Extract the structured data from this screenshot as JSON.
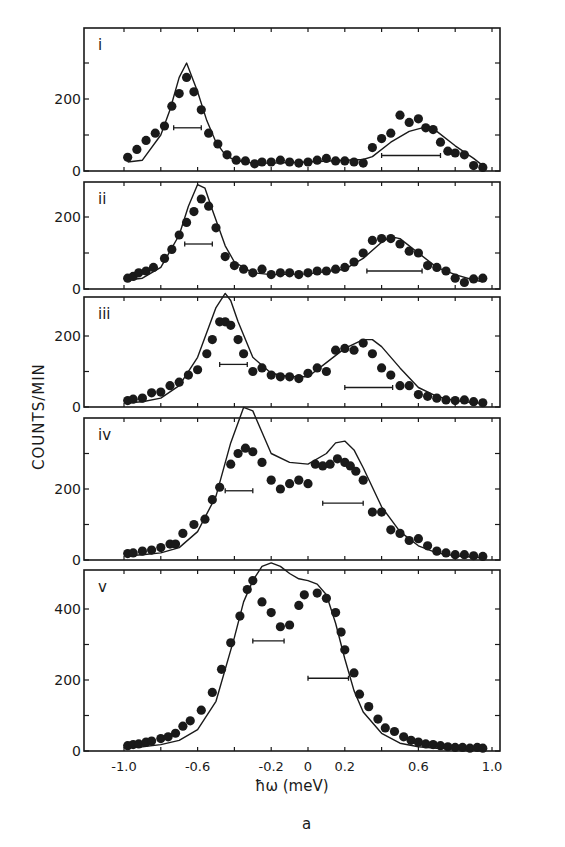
{
  "chart_data": [
    {
      "type": "scatter",
      "panel": "i",
      "xlabel": "ħω (meV)",
      "ylabel": "COUNTS/MIN",
      "xlim": [
        -1.2,
        1.2
      ],
      "ylim": [
        0,
        400
      ],
      "yticks": [
        0,
        200
      ],
      "series": [
        {
          "name": "data",
          "x": [
            -0.98,
            -0.93,
            -0.88,
            -0.83,
            -0.78,
            -0.74,
            -0.7,
            -0.66,
            -0.62,
            -0.58,
            -0.54,
            -0.49,
            -0.44,
            -0.39,
            -0.34,
            -0.29,
            -0.25,
            -0.2,
            -0.15,
            -0.1,
            -0.05,
            0,
            0.05,
            0.1,
            0.15,
            0.2,
            0.25,
            0.3,
            0.35,
            0.4,
            0.45,
            0.5,
            0.55,
            0.6,
            0.64,
            0.68,
            0.72,
            0.76,
            0.8,
            0.85,
            0.9,
            0.95
          ],
          "y": [
            38,
            60,
            85,
            105,
            125,
            180,
            215,
            260,
            220,
            170,
            105,
            75,
            45,
            30,
            28,
            20,
            25,
            25,
            30,
            25,
            22,
            25,
            30,
            35,
            28,
            28,
            25,
            22,
            65,
            90,
            105,
            155,
            135,
            145,
            120,
            115,
            80,
            55,
            50,
            45,
            15,
            10
          ]
        },
        {
          "name": "model",
          "x": [
            -0.98,
            -0.9,
            -0.8,
            -0.75,
            -0.7,
            -0.66,
            -0.6,
            -0.55,
            -0.5,
            -0.45,
            -0.4,
            -0.3,
            -0.2,
            0,
            0.2,
            0.3,
            0.35,
            0.45,
            0.55,
            0.62,
            0.7,
            0.8,
            0.9,
            0.95
          ],
          "y": [
            25,
            30,
            100,
            170,
            260,
            300,
            220,
            140,
            80,
            45,
            30,
            22,
            22,
            25,
            30,
            32,
            40,
            80,
            110,
            120,
            110,
            70,
            35,
            15
          ]
        }
      ],
      "resolution_bars": [
        {
          "x0": -0.73,
          "x1": -0.58,
          "y": 120
        },
        {
          "x0": 0.4,
          "x1": 0.72,
          "y": 43
        }
      ]
    },
    {
      "type": "scatter",
      "panel": "ii",
      "ylim": [
        0,
        300
      ],
      "yticks": [
        0,
        200
      ],
      "series": [
        {
          "name": "data",
          "x": [
            -0.98,
            -0.95,
            -0.92,
            -0.88,
            -0.84,
            -0.78,
            -0.74,
            -0.7,
            -0.66,
            -0.62,
            -0.58,
            -0.54,
            -0.5,
            -0.45,
            -0.4,
            -0.35,
            -0.3,
            -0.25,
            -0.2,
            -0.15,
            -0.1,
            -0.05,
            0,
            0.05,
            0.1,
            0.15,
            0.2,
            0.25,
            0.3,
            0.35,
            0.4,
            0.45,
            0.5,
            0.55,
            0.6,
            0.65,
            0.7,
            0.75,
            0.8,
            0.85,
            0.9,
            0.95
          ],
          "y": [
            30,
            35,
            45,
            50,
            60,
            85,
            110,
            150,
            185,
            215,
            250,
            230,
            170,
            90,
            65,
            55,
            45,
            55,
            40,
            45,
            45,
            40,
            45,
            50,
            50,
            55,
            60,
            75,
            100,
            135,
            140,
            140,
            125,
            105,
            100,
            65,
            60,
            50,
            30,
            18,
            28,
            30
          ]
        },
        {
          "name": "model",
          "x": [
            -0.98,
            -0.9,
            -0.8,
            -0.7,
            -0.65,
            -0.6,
            -0.56,
            -0.52,
            -0.45,
            -0.4,
            -0.3,
            -0.2,
            0,
            0.2,
            0.3,
            0.4,
            0.45,
            0.5,
            0.6,
            0.7,
            0.8,
            0.9,
            0.95
          ],
          "y": [
            25,
            30,
            60,
            150,
            230,
            290,
            280,
            220,
            120,
            75,
            45,
            40,
            42,
            55,
            85,
            130,
            145,
            140,
            100,
            60,
            40,
            25,
            20
          ]
        }
      ],
      "resolution_bars": [
        {
          "x0": -0.67,
          "x1": -0.52,
          "y": 125
        },
        {
          "x0": 0.32,
          "x1": 0.62,
          "y": 50
        }
      ]
    },
    {
      "type": "scatter",
      "panel": "iii",
      "ylim": [
        0,
        300
      ],
      "yticks": [
        0,
        200
      ],
      "series": [
        {
          "name": "data",
          "x": [
            -0.98,
            -0.95,
            -0.9,
            -0.85,
            -0.8,
            -0.75,
            -0.7,
            -0.65,
            -0.6,
            -0.55,
            -0.52,
            -0.48,
            -0.45,
            -0.42,
            -0.38,
            -0.35,
            -0.3,
            -0.25,
            -0.2,
            -0.15,
            -0.1,
            -0.05,
            0,
            0.05,
            0.1,
            0.15,
            0.2,
            0.25,
            0.3,
            0.35,
            0.4,
            0.45,
            0.5,
            0.55,
            0.6,
            0.65,
            0.7,
            0.75,
            0.8,
            0.85,
            0.9,
            0.95
          ],
          "y": [
            18,
            22,
            25,
            40,
            42,
            60,
            70,
            90,
            105,
            150,
            190,
            240,
            240,
            230,
            190,
            150,
            100,
            110,
            90,
            85,
            85,
            80,
            95,
            110,
            100,
            160,
            165,
            160,
            180,
            150,
            110,
            90,
            60,
            60,
            35,
            30,
            25,
            20,
            18,
            20,
            15,
            12
          ]
        },
        {
          "name": "model",
          "x": [
            -0.98,
            -0.9,
            -0.8,
            -0.7,
            -0.6,
            -0.5,
            -0.45,
            -0.42,
            -0.38,
            -0.3,
            -0.2,
            -0.1,
            0,
            0.1,
            0.2,
            0.3,
            0.35,
            0.4,
            0.5,
            0.6,
            0.7,
            0.8,
            0.9,
            0.95
          ],
          "y": [
            12,
            15,
            25,
            60,
            140,
            280,
            320,
            300,
            240,
            140,
            95,
            85,
            85,
            125,
            165,
            190,
            190,
            170,
            110,
            55,
            30,
            18,
            12,
            10
          ]
        }
      ],
      "resolution_bars": [
        {
          "x0": -0.48,
          "x1": -0.33,
          "y": 120
        },
        {
          "x0": 0.2,
          "x1": 0.46,
          "y": 55
        }
      ]
    },
    {
      "type": "scatter",
      "panel": "iv",
      "ylim": [
        0,
        400
      ],
      "yticks": [
        0,
        200
      ],
      "series": [
        {
          "name": "data",
          "x": [
            -0.98,
            -0.95,
            -0.9,
            -0.85,
            -0.8,
            -0.75,
            -0.72,
            -0.68,
            -0.62,
            -0.56,
            -0.52,
            -0.48,
            -0.42,
            -0.38,
            -0.34,
            -0.3,
            -0.25,
            -0.2,
            -0.15,
            -0.1,
            -0.05,
            0,
            0.04,
            0.08,
            0.12,
            0.16,
            0.2,
            0.23,
            0.26,
            0.3,
            0.35,
            0.4,
            0.45,
            0.5,
            0.55,
            0.6,
            0.65,
            0.7,
            0.75,
            0.8,
            0.85,
            0.9,
            0.95
          ],
          "y": [
            18,
            20,
            25,
            28,
            35,
            45,
            45,
            75,
            100,
            115,
            170,
            205,
            270,
            300,
            315,
            305,
            275,
            225,
            200,
            215,
            225,
            215,
            270,
            265,
            270,
            285,
            275,
            265,
            250,
            225,
            135,
            135,
            85,
            75,
            55,
            60,
            40,
            25,
            20,
            15,
            15,
            12,
            10
          ]
        },
        {
          "name": "model",
          "x": [
            -0.98,
            -0.9,
            -0.8,
            -0.7,
            -0.6,
            -0.5,
            -0.42,
            -0.35,
            -0.3,
            -0.25,
            -0.2,
            -0.1,
            0,
            0.1,
            0.15,
            0.2,
            0.25,
            0.3,
            0.4,
            0.5,
            0.6,
            0.7,
            0.8,
            0.9,
            0.95
          ],
          "y": [
            12,
            15,
            20,
            35,
            80,
            180,
            330,
            430,
            420,
            360,
            300,
            275,
            270,
            300,
            330,
            335,
            310,
            260,
            150,
            80,
            40,
            20,
            12,
            8,
            6
          ]
        }
      ],
      "resolution_bars": [
        {
          "x0": -0.45,
          "x1": -0.3,
          "y": 195
        },
        {
          "x0": 0.08,
          "x1": 0.3,
          "y": 160
        }
      ]
    },
    {
      "type": "scatter",
      "panel": "v",
      "ylim": [
        0,
        500
      ],
      "yticks": [
        0,
        200,
        400
      ],
      "series": [
        {
          "name": "data",
          "x": [
            -0.98,
            -0.95,
            -0.92,
            -0.88,
            -0.85,
            -0.8,
            -0.76,
            -0.72,
            -0.68,
            -0.64,
            -0.58,
            -0.52,
            -0.47,
            -0.42,
            -0.37,
            -0.33,
            -0.3,
            -0.25,
            -0.2,
            -0.15,
            -0.1,
            -0.05,
            -0.02,
            0.05,
            0.1,
            0.15,
            0.18,
            0.2,
            0.25,
            0.28,
            0.33,
            0.38,
            0.42,
            0.47,
            0.52,
            0.56,
            0.6,
            0.64,
            0.68,
            0.72,
            0.76,
            0.8,
            0.84,
            0.88,
            0.92,
            0.95
          ],
          "y": [
            15,
            18,
            20,
            25,
            28,
            35,
            40,
            50,
            70,
            85,
            115,
            165,
            230,
            305,
            380,
            455,
            480,
            420,
            390,
            350,
            355,
            410,
            440,
            445,
            430,
            390,
            335,
            285,
            220,
            160,
            125,
            90,
            65,
            55,
            40,
            30,
            25,
            20,
            18,
            15,
            12,
            10,
            10,
            8,
            10,
            8
          ]
        },
        {
          "name": "model",
          "x": [
            -0.98,
            -0.9,
            -0.8,
            -0.7,
            -0.6,
            -0.5,
            -0.4,
            -0.35,
            -0.3,
            -0.25,
            -0.2,
            -0.15,
            -0.1,
            -0.05,
            0,
            0.05,
            0.1,
            0.15,
            0.2,
            0.25,
            0.3,
            0.4,
            0.5,
            0.6,
            0.7,
            0.8,
            0.9,
            0.95
          ],
          "y": [
            10,
            12,
            18,
            30,
            60,
            140,
            320,
            420,
            480,
            520,
            530,
            520,
            500,
            485,
            480,
            470,
            440,
            360,
            260,
            170,
            110,
            50,
            22,
            12,
            8,
            6,
            5,
            4
          ]
        }
      ],
      "resolution_bars": [
        {
          "x0": -0.3,
          "x1": -0.13,
          "y": 310
        },
        {
          "x0": 0.0,
          "x1": 0.22,
          "y": 205
        }
      ]
    }
  ],
  "labels": {
    "ylabel": "COUNTS/MIN",
    "xlabel": "ħω  (meV)",
    "caption": "a",
    "panel_labels": [
      "i",
      "ii",
      "iii",
      "iv",
      "v"
    ],
    "xticks": [
      "-1.0",
      "-0.6",
      "-0.2",
      "0",
      "0.2",
      "0.6",
      "1.0"
    ],
    "xtick_values": [
      -1.0,
      -0.6,
      -0.2,
      0,
      0.2,
      0.6,
      1.0
    ]
  },
  "layout": {
    "frame_left": 84,
    "frame_right": 500,
    "x_origin_px": 308,
    "px_per_meV": 184,
    "panels": [
      {
        "top": 28,
        "zero": 171,
        "px_per_count": 0.36,
        "ytick_labels": [
          "0",
          "200"
        ],
        "minor_ticks": [
          100,
          300
        ]
      },
      {
        "top": 182,
        "zero": 289,
        "px_per_count": 0.36,
        "ytick_labels": [
          "0",
          "200"
        ],
        "minor_ticks": [
          100
        ]
      },
      {
        "top": 297,
        "zero": 407,
        "px_per_count": 0.355,
        "ytick_labels": [
          "0",
          "200"
        ],
        "minor_ticks": [
          100
        ]
      },
      {
        "top": 418,
        "zero": 560,
        "px_per_count": 0.355,
        "ytick_labels": [
          "0",
          "200"
        ],
        "minor_ticks": [
          100,
          300
        ]
      },
      {
        "top": 570,
        "zero": 751,
        "px_per_count": 0.355,
        "ytick_labels": [
          "0",
          "200",
          "400"
        ],
        "minor_ticks": [
          100,
          300
        ]
      }
    ]
  }
}
